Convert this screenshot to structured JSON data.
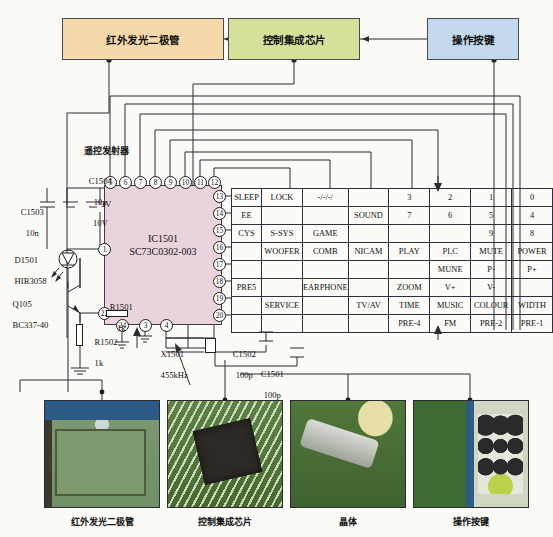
{
  "diagram": {
    "title_blocks": [
      {
        "id": "led",
        "label": "红外发光二极管",
        "color": "#f6d9ab"
      },
      {
        "id": "ic",
        "label": "控制集成芯片",
        "color": "#d7e09a"
      },
      {
        "id": "key",
        "label": "操作按键",
        "color": "#c3d8ec"
      }
    ],
    "section_label": "遥控发射器",
    "ic": {
      "designator": "IC1501",
      "part_number": "SC73C0302-003",
      "body_color": "#e9d4de",
      "pins_top": [
        "5",
        "6",
        "7",
        "8",
        "9",
        "10",
        "11",
        "12"
      ],
      "pins_right": [
        "13",
        "14",
        "15",
        "16",
        "17",
        "18",
        "19",
        "20"
      ],
      "pins_left": [
        "1",
        "22"
      ],
      "pins_bottom": [
        "24",
        "3",
        "4"
      ]
    },
    "components": [
      {
        "ref": "C1504",
        "value": "10μ",
        "rating": "10V"
      },
      {
        "ref": "C1503",
        "value": "10n",
        "rating": ""
      },
      {
        "ref": "BAT",
        "value": "3V",
        "rating": ""
      },
      {
        "ref": "D1501",
        "value": "HIR3058",
        "rating": ""
      },
      {
        "ref": "Q105",
        "value": "BC337-40",
        "rating": ""
      },
      {
        "ref": "R1501",
        "value": "1k",
        "rating": ""
      },
      {
        "ref": "R1502",
        "value": "1k",
        "rating": ""
      },
      {
        "ref": "X1501",
        "value": "455kHz",
        "rating": ""
      },
      {
        "ref": "C1502",
        "value": "100p",
        "rating": ""
      },
      {
        "ref": "C1501",
        "value": "100p",
        "rating": ""
      }
    ],
    "key_matrix": {
      "rows": [
        [
          "SLEEP",
          "LOCK",
          "-/-/-/",
          "",
          "3",
          "2",
          "1",
          "0"
        ],
        [
          "EE",
          "",
          "",
          "SOUND",
          "7",
          "6",
          "5",
          "4"
        ],
        [
          "CYS",
          "S-SYS",
          "GAME",
          "",
          "",
          "",
          "9",
          "8"
        ],
        [
          "",
          "WOOFER",
          "COMB",
          "NICAM",
          "PLAY",
          "PLC",
          "MUTE",
          "POWER"
        ],
        [
          "",
          "",
          "",
          "",
          "",
          "MUNE",
          "P-",
          "P+"
        ],
        [
          "PRE5",
          "",
          "EARPHONE",
          "",
          "ZOOM",
          "V+",
          "V-",
          ""
        ],
        [
          "",
          "SERVICE",
          "",
          "TV/AV",
          "TIME",
          "MUSIC",
          "COLOUR",
          "WIDTH"
        ],
        [
          "",
          "",
          "",
          "",
          "PRE-4",
          "FM",
          "PRE-2",
          "PRE-1"
        ]
      ]
    },
    "photos": [
      {
        "id": "photo-led",
        "caption": "红外发光二极管"
      },
      {
        "id": "photo-ic",
        "caption": "控制集成芯片"
      },
      {
        "id": "photo-xtal",
        "caption": "晶体"
      },
      {
        "id": "photo-keypad",
        "caption": "操作按键"
      }
    ]
  }
}
